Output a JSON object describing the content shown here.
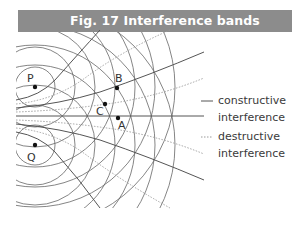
{
  "figure": {
    "title": "Fig. 17 Interference bands",
    "title_bg_color": "#8c8c8c",
    "title_text_color": "#ffffff"
  },
  "diagram": {
    "sources": [
      {
        "label": "P",
        "x": 35,
        "y": 87
      },
      {
        "label": "Q",
        "x": 35,
        "y": 145
      }
    ],
    "points": [
      {
        "label": "B",
        "x": 117,
        "y": 88
      },
      {
        "label": "C",
        "x": 105,
        "y": 104
      },
      {
        "label": "A",
        "x": 118,
        "y": 118
      }
    ],
    "wavefront_spacing": 20,
    "line_color": "#5a5a5a",
    "dotted_color": "#9a9a9a"
  },
  "legend": {
    "items": [
      {
        "style": "solid",
        "label_line1": "constructive",
        "label_line2": "interference"
      },
      {
        "style": "dotted",
        "label_line1": "destructive",
        "label_line2": "interference"
      }
    ]
  }
}
